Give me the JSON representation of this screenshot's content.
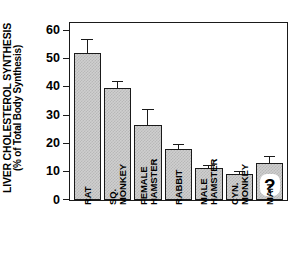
{
  "chart_data": {
    "type": "bar",
    "title": "",
    "ylabel": "LIVER CHOLESTEROL SYNTHESIS (% of Total Body Synthesis)",
    "ylabel_line1": "LIVER CHOLESTEROL SYNTHESIS",
    "ylabel_line2": "(% of Total Body Synthesis)",
    "xlabel": "",
    "ylim": [
      0,
      63
    ],
    "yticks": [
      0,
      10,
      20,
      30,
      40,
      50,
      60
    ],
    "ytick_labels": [
      "0",
      "10",
      "20",
      "30",
      "40",
      "50",
      "60"
    ],
    "grid": false,
    "legend": false,
    "categories": [
      "RAT",
      "SQ. MONKEY",
      "FEMALE HAMSTER",
      "RABBIT",
      "MALE HAMSTER",
      "CYN. MONKEY",
      "MAN"
    ],
    "category_label_lines": [
      [
        "RAT"
      ],
      [
        "SQ.",
        "MONKEY"
      ],
      [
        "FEMALE",
        "HAMSTER"
      ],
      [
        "RABBIT"
      ],
      [
        "MALE",
        "HAMSTER"
      ],
      [
        "CYN.",
        "MONKEY"
      ],
      [
        "MAN"
      ]
    ],
    "values": [
      52.2,
      39.6,
      26.5,
      18.1,
      11.2,
      9.3,
      13.1
    ],
    "errors": [
      4.6,
      2.3,
      5.6,
      1.4,
      0.8,
      0.7,
      2.3
    ],
    "bar_fill": "#cfcfcf",
    "bar_hatch": "cross-hatch",
    "bar_edge": "#1a1a1a",
    "annotations": [
      {
        "category": "MAN",
        "text": "?",
        "style": "white-rounded-badge"
      }
    ]
  }
}
